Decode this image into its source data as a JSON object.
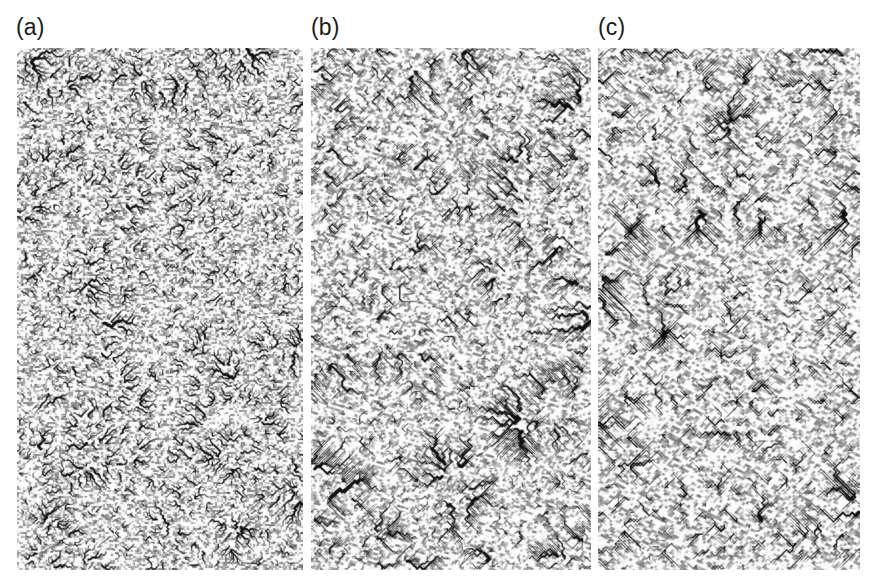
{
  "figure": {
    "type": "multi-panel-raster-figure",
    "background_color": "#ffffff",
    "width": 871,
    "height": 587
  },
  "panels": [
    {
      "label": "(a)",
      "label_x": 16,
      "label_y": 16,
      "x": 17,
      "y": 48,
      "width": 286,
      "height": 522,
      "description": "Isotropic dendritic drainage network, fine-grained mottled texture",
      "anisotropy": 0.0,
      "seed": 1147,
      "grid_cols": 150,
      "grid_rows": 274,
      "texture_scale": 2,
      "trunk_count": 9,
      "trunk_width": 3.1,
      "branch_meander": 1.0,
      "background_gray": "#f2f2f2",
      "ink_color": "#111111"
    },
    {
      "label": "(b)",
      "label_x": 311,
      "label_y": 16,
      "x": 311,
      "y": 48,
      "width": 280,
      "height": 522,
      "description": "Intermediate anisotropy, channels straighten into angular diagonal reaches",
      "anisotropy": 0.55,
      "seed": 2291,
      "grid_cols": 112,
      "grid_rows": 209,
      "texture_scale": 2.5,
      "trunk_count": 7,
      "trunk_width": 3.3,
      "branch_meander": 0.45,
      "background_gray": "#f4f4f4",
      "ink_color": "#111111"
    },
    {
      "label": "(c)",
      "label_x": 598,
      "label_y": 16,
      "x": 598,
      "y": 48,
      "width": 262,
      "height": 522,
      "description": "Strong anisotropy, long straight 45 degree diagonal trunk channels",
      "anisotropy": 0.95,
      "seed": 3377,
      "grid_cols": 84,
      "grid_rows": 168,
      "texture_scale": 3.1,
      "trunk_count": 5,
      "trunk_width": 3.6,
      "branch_meander": 0.12,
      "background_gray": "#f5f5f5",
      "ink_color": "#0d0d0d"
    }
  ],
  "chart_data": {
    "type": "heatmap",
    "title": "",
    "xlabel": "",
    "ylabel": "",
    "panel_labels": [
      "(a)",
      "(b)",
      "(c)"
    ],
    "series": [
      {
        "name": "(a)",
        "anisotropy": 0.0,
        "mean_channel_sinuosity": 1.42,
        "drainage_density": 1.0
      },
      {
        "name": "(b)",
        "anisotropy": 0.55,
        "mean_channel_sinuosity": 1.18,
        "drainage_density": 0.72
      },
      {
        "name": "(c)",
        "anisotropy": 0.95,
        "mean_channel_sinuosity": 1.04,
        "drainage_density": 0.48
      }
    ],
    "legend_position": "none",
    "grid": false
  }
}
